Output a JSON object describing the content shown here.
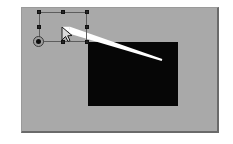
{
  "app": {
    "title": "Graphics Canvas",
    "view_label": "Drawing canvas"
  },
  "canvas": {
    "label": "Canvas page",
    "background_color": "#a9a9a9",
    "frame_color": "#6a6a6a",
    "outer_background": "#ffffff",
    "x": 21,
    "y": 7,
    "width": 198,
    "height": 126
  },
  "shapes": [
    {
      "name": "black-rectangle",
      "type": "rectangle",
      "fill_color": "#060606",
      "x": 87,
      "y": 41,
      "width": 90,
      "height": 64,
      "label": "Filled rectangle"
    },
    {
      "name": "white-beam-stroke",
      "type": "tapered-stroke",
      "fill_color": "#ffffff",
      "label": "White tapering beam stroke",
      "start_x": 68,
      "start_y": 29,
      "end_x": 161,
      "end_y": 59
    }
  ],
  "selection": {
    "label": "Selection bounding box",
    "stroke_color": "#5d5d5d",
    "x": 38,
    "y": 11,
    "width": 48,
    "height": 30,
    "handle_color": "#262626",
    "handles": [
      {
        "name": "handle-top-left",
        "label": "Top left resize handle",
        "left": 0,
        "top": 0
      },
      {
        "name": "handle-top-center",
        "label": "Top center resize handle",
        "left": 24,
        "top": 0
      },
      {
        "name": "handle-top-right",
        "label": "Top right resize handle",
        "left": 48,
        "top": 0
      },
      {
        "name": "handle-middle-left",
        "label": "Middle left resize handle",
        "left": 0,
        "top": 15
      },
      {
        "name": "handle-middle-right",
        "label": "Middle right resize handle",
        "left": 48,
        "top": 15
      },
      {
        "name": "handle-bottom-left",
        "label": "Bottom left resize handle",
        "left": 0,
        "top": 30
      },
      {
        "name": "handle-bottom-center",
        "label": "Bottom center resize handle",
        "left": 24,
        "top": 30
      },
      {
        "name": "handle-bottom-right",
        "label": "Bottom right resize handle",
        "left": 48,
        "top": 30
      }
    ],
    "pivot": {
      "name": "pivot-handle",
      "label": "Rotation anchor point",
      "x": 38,
      "y": 41,
      "color": "#0c0c0c"
    }
  },
  "cursor": {
    "name": "mouse-pointer",
    "icon": "arrow-cursor-icon",
    "label": "Mouse pointer",
    "x": 60,
    "y": 25,
    "fill_color": "#d9d9d9",
    "stroke_color": "#1a1a1a"
  }
}
